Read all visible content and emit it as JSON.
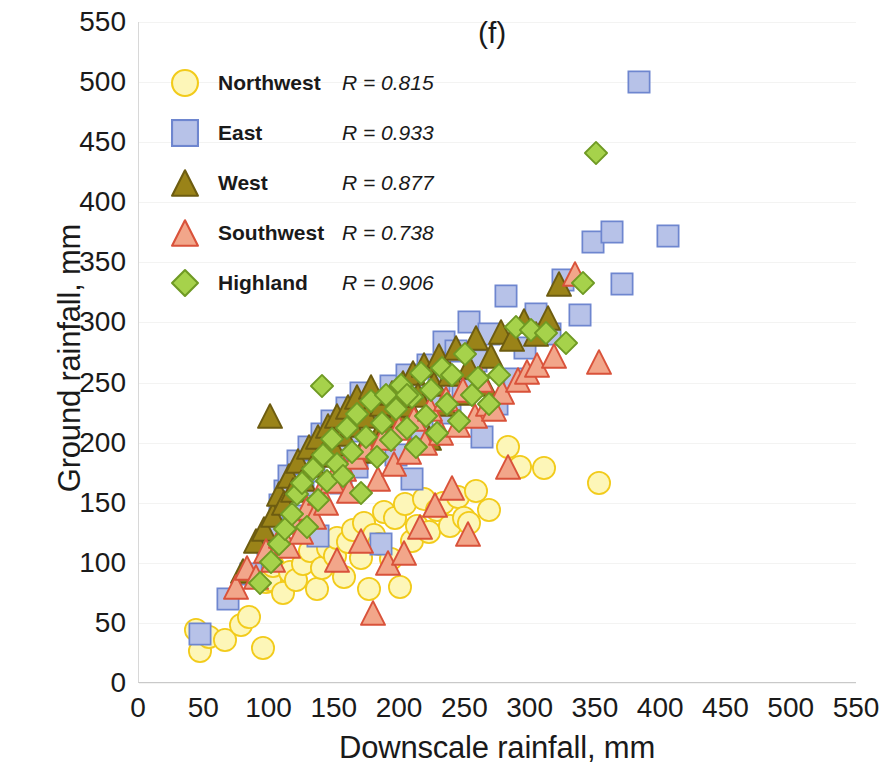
{
  "panel_label": "(f)",
  "chart_data": {
    "type": "scatter",
    "title": "(f)",
    "xlabel": "Downscale rainfall, mm",
    "ylabel": "Ground rainfall, mm",
    "xlim": [
      0,
      550
    ],
    "ylim": [
      0,
      550
    ],
    "xticks": [
      0,
      50,
      100,
      150,
      200,
      250,
      300,
      350,
      400,
      450,
      500,
      550
    ],
    "yticks": [
      0,
      50,
      100,
      150,
      200,
      250,
      300,
      350,
      400,
      450,
      500,
      550
    ],
    "grid": "horizontal-faint",
    "legend_position": "upper-left-inside",
    "series": [
      {
        "name": "Northwest",
        "r_label": "R = 0.815",
        "r_value": 0.815,
        "marker": "circle",
        "fill": "#fdf6b8",
        "stroke": "#f2cb1b",
        "points": [
          [
            44,
            44
          ],
          [
            47,
            27
          ],
          [
            54,
            38
          ],
          [
            66,
            36
          ],
          [
            78,
            48
          ],
          [
            84,
            55
          ],
          [
            95,
            29
          ],
          [
            97,
            84
          ],
          [
            100,
            86
          ],
          [
            103,
            97
          ],
          [
            110,
            75
          ],
          [
            116,
            92
          ],
          [
            120,
            86
          ],
          [
            126,
            99
          ],
          [
            131,
            110
          ],
          [
            136,
            78
          ],
          [
            140,
            96
          ],
          [
            145,
            112
          ],
          [
            150,
            106
          ],
          [
            152,
            121
          ],
          [
            157,
            88
          ],
          [
            160,
            117
          ],
          [
            164,
            127
          ],
          [
            170,
            104
          ],
          [
            172,
            133
          ],
          [
            176,
            78
          ],
          [
            180,
            123
          ],
          [
            184,
            116
          ],
          [
            188,
            142
          ],
          [
            193,
            103
          ],
          [
            196,
            137
          ],
          [
            200,
            80
          ],
          [
            204,
            149
          ],
          [
            209,
            118
          ],
          [
            213,
            131
          ],
          [
            218,
            153
          ],
          [
            222,
            126
          ],
          [
            228,
            144
          ],
          [
            233,
            150
          ],
          [
            238,
            131
          ],
          [
            244,
            155
          ],
          [
            249,
            137
          ],
          [
            253,
            133
          ],
          [
            258,
            160
          ],
          [
            268,
            144
          ],
          [
            283,
            196
          ],
          [
            292,
            180
          ],
          [
            310,
            179
          ],
          [
            352,
            166
          ]
        ]
      },
      {
        "name": "East",
        "r_label": "R = 0.933",
        "r_value": 0.933,
        "marker": "square",
        "fill": "#b7c2e8",
        "stroke": "#6e86cf",
        "points": [
          [
            47,
            41
          ],
          [
            68,
            70
          ],
          [
            86,
            91
          ],
          [
            99,
            116
          ],
          [
            104,
            128
          ],
          [
            108,
            148
          ],
          [
            112,
            160
          ],
          [
            115,
            172
          ],
          [
            118,
            139
          ],
          [
            122,
            185
          ],
          [
            126,
            165
          ],
          [
            130,
            196
          ],
          [
            134,
            176
          ],
          [
            137,
            122
          ],
          [
            140,
            207
          ],
          [
            144,
            190
          ],
          [
            148,
            218
          ],
          [
            152,
            201
          ],
          [
            155,
            166
          ],
          [
            159,
            229
          ],
          [
            163,
            210
          ],
          [
            167,
            180
          ],
          [
            170,
            241
          ],
          [
            174,
            222
          ],
          [
            178,
            198
          ],
          [
            182,
            233
          ],
          [
            185,
            116
          ],
          [
            189,
            214
          ],
          [
            193,
            247
          ],
          [
            197,
            190
          ],
          [
            201,
            228
          ],
          [
            205,
            256
          ],
          [
            209,
            170
          ],
          [
            213,
            240
          ],
          [
            217,
            212
          ],
          [
            221,
            265
          ],
          [
            226,
            232
          ],
          [
            230,
            251
          ],
          [
            234,
            284
          ],
          [
            238,
            225
          ],
          [
            243,
            276
          ],
          [
            248,
            244
          ],
          [
            253,
            300
          ],
          [
            258,
            268
          ],
          [
            263,
            205
          ],
          [
            268,
            290
          ],
          [
            274,
            232
          ],
          [
            281,
            322
          ],
          [
            288,
            253
          ],
          [
            296,
            279
          ],
          [
            304,
            307
          ],
          [
            315,
            290
          ],
          [
            325,
            335
          ],
          [
            338,
            306
          ],
          [
            348,
            367
          ],
          [
            362,
            375
          ],
          [
            370,
            332
          ],
          [
            383,
            500
          ],
          [
            405,
            372
          ]
        ]
      },
      {
        "name": "West",
        "r_label": "R = 0.877",
        "r_value": 0.877,
        "marker": "triangle",
        "fill": "#9a8318",
        "stroke": "#6d5c10",
        "points": [
          [
            80,
            93
          ],
          [
            90,
            118
          ],
          [
            96,
            128
          ],
          [
            100,
            222
          ],
          [
            103,
            140
          ],
          [
            107,
            157
          ],
          [
            111,
            150
          ],
          [
            115,
            172
          ],
          [
            118,
            161
          ],
          [
            122,
            185
          ],
          [
            126,
            170
          ],
          [
            130,
            196
          ],
          [
            133,
            181
          ],
          [
            137,
            205
          ],
          [
            141,
            190
          ],
          [
            145,
            214
          ],
          [
            148,
            199
          ],
          [
            152,
            222
          ],
          [
            156,
            207
          ],
          [
            160,
            230
          ],
          [
            163,
            215
          ],
          [
            167,
            238
          ],
          [
            171,
            193
          ],
          [
            175,
            222
          ],
          [
            178,
            246
          ],
          [
            182,
            205
          ],
          [
            186,
            232
          ],
          [
            190,
            213
          ],
          [
            194,
            241
          ],
          [
            198,
            223
          ],
          [
            202,
            250
          ],
          [
            206,
            231
          ],
          [
            210,
            258
          ],
          [
            214,
            240
          ],
          [
            218,
            265
          ],
          [
            222,
            204
          ],
          [
            226,
            249
          ],
          [
            230,
            272
          ],
          [
            234,
            232
          ],
          [
            238,
            257
          ],
          [
            243,
            279
          ],
          [
            248,
            241
          ],
          [
            253,
            263
          ],
          [
            258,
            287
          ],
          [
            264,
            249
          ],
          [
            270,
            272
          ],
          [
            277,
            292
          ],
          [
            286,
            286
          ],
          [
            295,
            301
          ],
          [
            304,
            290
          ],
          [
            313,
            304
          ],
          [
            322,
            332
          ]
        ]
      },
      {
        "name": "Southwest",
        "r_label": "R = 0.738",
        "r_value": 0.738,
        "marker": "triangle",
        "fill": "#f2a68a",
        "stroke": "#d9523a",
        "points": [
          [
            74,
            80
          ],
          [
            83,
            96
          ],
          [
            90,
            88
          ],
          [
            97,
            110
          ],
          [
            103,
            102
          ],
          [
            109,
            122
          ],
          [
            114,
            114
          ],
          [
            119,
            134
          ],
          [
            124,
            126
          ],
          [
            129,
            146
          ],
          [
            134,
            138
          ],
          [
            139,
            158
          ],
          [
            143,
            150
          ],
          [
            148,
            168
          ],
          [
            152,
            102
          ],
          [
            157,
            178
          ],
          [
            161,
            160
          ],
          [
            166,
            188
          ],
          [
            170,
            118
          ],
          [
            174,
            196
          ],
          [
            179,
            58
          ],
          [
            183,
            170
          ],
          [
            187,
            204
          ],
          [
            191,
            100
          ],
          [
            195,
            182
          ],
          [
            199,
            212
          ],
          [
            203,
            108
          ],
          [
            207,
            192
          ],
          [
            211,
            220
          ],
          [
            215,
            130
          ],
          [
            219,
            200
          ],
          [
            223,
            228
          ],
          [
            227,
            148
          ],
          [
            231,
            208
          ],
          [
            235,
            236
          ],
          [
            240,
            162
          ],
          [
            244,
            215
          ],
          [
            248,
            244
          ],
          [
            252,
            124
          ],
          [
            257,
            222
          ],
          [
            262,
            252
          ],
          [
            267,
            232
          ],
          [
            272,
            228
          ],
          [
            278,
            242
          ],
          [
            283,
            180
          ],
          [
            290,
            252
          ],
          [
            297,
            259
          ],
          [
            305,
            265
          ],
          [
            318,
            272
          ],
          [
            334,
            340
          ],
          [
            352,
            267
          ]
        ]
      },
      {
        "name": "Highland",
        "r_label": "R = 0.906",
        "r_value": 0.906,
        "marker": "diamond",
        "fill": "#a6d24b",
        "stroke": "#6f9a24",
        "points": [
          [
            93,
            83
          ],
          [
            101,
            101
          ],
          [
            107,
            116
          ],
          [
            112,
            128
          ],
          [
            117,
            141
          ],
          [
            121,
            157
          ],
          [
            125,
            166
          ],
          [
            129,
            130
          ],
          [
            133,
            178
          ],
          [
            137,
            152
          ],
          [
            141,
            190
          ],
          [
            144,
            168
          ],
          [
            148,
            203
          ],
          [
            152,
            182
          ],
          [
            140,
            247
          ],
          [
            156,
            172
          ],
          [
            159,
            212
          ],
          [
            163,
            192
          ],
          [
            167,
            224
          ],
          [
            170,
            158
          ],
          [
            174,
            205
          ],
          [
            178,
            235
          ],
          [
            182,
            188
          ],
          [
            186,
            216
          ],
          [
            189,
            240
          ],
          [
            193,
            202
          ],
          [
            197,
            228
          ],
          [
            201,
            248
          ],
          [
            205,
            212
          ],
          [
            209,
            238
          ],
          [
            212,
            196
          ],
          [
            216,
            258
          ],
          [
            220,
            222
          ],
          [
            224,
            244
          ],
          [
            228,
            208
          ],
          [
            232,
            262
          ],
          [
            236,
            232
          ],
          [
            240,
            256
          ],
          [
            245,
            218
          ],
          [
            250,
            274
          ],
          [
            255,
            240
          ],
          [
            260,
            254
          ],
          [
            205,
            240
          ],
          [
            268,
            232
          ],
          [
            276,
            256
          ],
          [
            289,
            296
          ],
          [
            300,
            294
          ],
          [
            312,
            291
          ],
          [
            327,
            283
          ],
          [
            340,
            333
          ],
          [
            350,
            441
          ]
        ]
      }
    ]
  },
  "legend": [
    {
      "name": "Northwest",
      "r": "R = 0.815"
    },
    {
      "name": "East",
      "r": "R = 0.933"
    },
    {
      "name": "West",
      "r": "R = 0.877"
    },
    {
      "name": "Southwest",
      "r": "R = 0.738"
    },
    {
      "name": "Highland",
      "r": "R = 0.906"
    }
  ],
  "colors": {
    "northwest_fill": "#fdf6b8",
    "northwest_stroke": "#f2cb1b",
    "east_fill": "#b7c2e8",
    "east_stroke": "#6e86cf",
    "west_fill": "#9a8318",
    "west_stroke": "#6d5c10",
    "southwest_fill": "#f2a68a",
    "southwest_stroke": "#d9523a",
    "highland_fill": "#a6d24b",
    "highland_stroke": "#6f9a24",
    "grid": "#f3f3f2",
    "axis": "#cfcfcf",
    "text": "#1a1a1a"
  }
}
